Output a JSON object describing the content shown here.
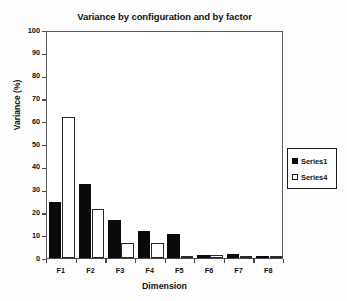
{
  "chart_data": {
    "type": "bar",
    "title": "Variance by configuration and by factor",
    "xlabel": "Dimension",
    "ylabel": "Variance (%)",
    "categories": [
      "F1",
      "F2",
      "F3",
      "F4",
      "F5",
      "F6",
      "F7",
      "F8"
    ],
    "series": [
      {
        "name": "Series1",
        "color": "#000000",
        "values": [
          24.5,
          32.5,
          16.5,
          12.0,
          10.5,
          1.2,
          1.8,
          0.4
        ]
      },
      {
        "name": "Series4",
        "color": "#ffffff",
        "values": [
          62.0,
          21.5,
          6.7,
          6.7,
          0.8,
          1.2,
          1.0,
          0.4
        ]
      }
    ],
    "ylim": [
      0,
      100
    ],
    "yticks": [
      0,
      10,
      20,
      30,
      40,
      50,
      60,
      70,
      80,
      90,
      100
    ],
    "ytick_labels": [
      "0",
      "10",
      "20",
      "30",
      "40",
      "50",
      "60",
      "70",
      "80",
      "90",
      "100"
    ],
    "grid": false,
    "legend_position": "right",
    "legend_entries": [
      "Series1",
      "Series4"
    ]
  },
  "colors": {
    "series1": "#000000",
    "series4": "#ffffff",
    "axis": "#4a4a4a",
    "text": "#111111",
    "background": "#fdfdfd"
  }
}
